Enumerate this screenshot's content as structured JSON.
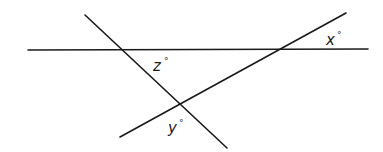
{
  "diagram": {
    "lines": [
      {
        "name": "horizontal-line",
        "x1": 28,
        "y1": 50,
        "x2": 368,
        "y2": 49
      },
      {
        "name": "transversal-descending",
        "x1": 85,
        "y1": 15,
        "x2": 227,
        "y2": 148
      },
      {
        "name": "transversal-ascending",
        "x1": 120,
        "y1": 137,
        "x2": 346,
        "y2": 13
      }
    ],
    "labels": [
      {
        "name": "angle-label-z",
        "var": "z",
        "degree": "°",
        "x": 153,
        "y": 71
      },
      {
        "name": "angle-label-x",
        "var": "x",
        "degree": "°",
        "x": 326,
        "y": 45
      },
      {
        "name": "angle-label-y",
        "var": "y",
        "degree": "°",
        "x": 168,
        "y": 133
      }
    ]
  }
}
